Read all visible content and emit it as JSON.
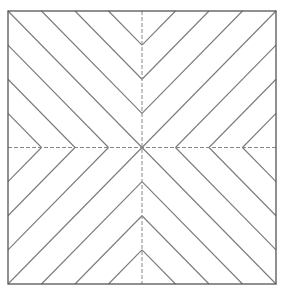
{
  "diagram": {
    "type": "herringbone-chevron-pattern",
    "canvas": {
      "width": 281,
      "height": 293
    },
    "frame": {
      "x1": 8,
      "y1": 11,
      "x2": 276,
      "y2": 284,
      "stroke": "#555555",
      "stroke_width": 1.3
    },
    "center": {
      "x": 142,
      "y": 147.5
    },
    "stripes_per_half": 4,
    "hatch": {
      "stroke": "#7a7a7a",
      "stroke_width": 1.1
    },
    "center_lines": {
      "stroke": "#888888",
      "stroke_width": 1,
      "dash": "4 2"
    },
    "quadrants": [
      {
        "name": "top-left",
        "direction": "down-right"
      },
      {
        "name": "top-right",
        "direction": "down-left"
      },
      {
        "name": "bottom-left",
        "direction": "up-right"
      },
      {
        "name": "bottom-right",
        "direction": "up-left"
      }
    ]
  }
}
